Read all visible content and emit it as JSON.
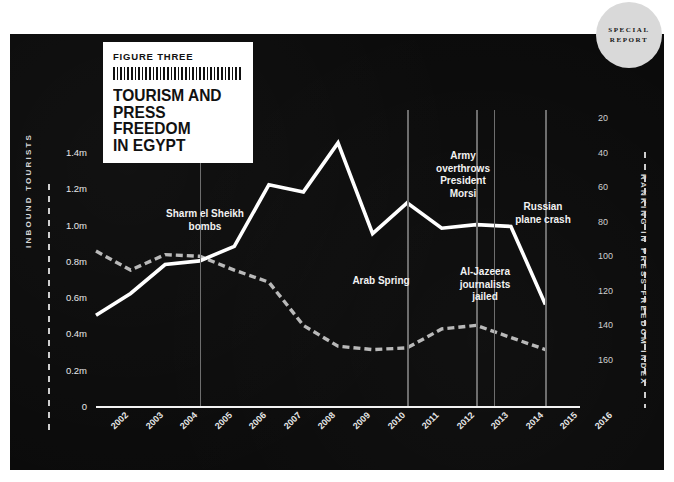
{
  "badge": {
    "line1": "SPECIAL",
    "line2": "REPORT"
  },
  "title": {
    "figure_label": "FIGURE THREE",
    "line1": "TOURISM AND",
    "line2": "PRESS FREEDOM",
    "line3": "IN EGYPT"
  },
  "axes": {
    "left_title": "INBOUND TOURISTS",
    "right_title": "RANKING IN PRESS FREEDOM INDEX"
  },
  "sources": "SOURCES: UNWTO, Press Freedom Index, Reporters Without Borders",
  "annotations": [
    {
      "text": "Sharm el Sheikh\nbombs",
      "year": 2005
    },
    {
      "text": "Arab Spring",
      "year": 2011
    },
    {
      "text": "Army\noverthrows\nPresident\nMorsi",
      "year": 2013
    },
    {
      "text": "Al-Jazeera\njournalists\njailed",
      "year": 2013
    },
    {
      "text": "Russian\nplane crash",
      "year": 2015
    }
  ],
  "chart_data": {
    "type": "line",
    "title": "TOURISM AND PRESS FREEDOM IN EGYPT",
    "xlabel": "",
    "x": [
      2002,
      2003,
      2004,
      2005,
      2006,
      2007,
      2008,
      2009,
      2010,
      2011,
      2012,
      2013,
      2014,
      2015
    ],
    "tick_labels": [
      "2002",
      "2003",
      "2004",
      "2005",
      "2006",
      "2007",
      "2008",
      "2009",
      "2010",
      "2011",
      "2012",
      "2013",
      "2014",
      "2015",
      "2016"
    ],
    "grid": false,
    "legend_position": "none",
    "series": [
      {
        "name": "Inbound tourists",
        "style": "solid",
        "axis": "left",
        "ylabel": "INBOUND TOURISTS",
        "ylim": [
          0,
          1.5
        ],
        "yticks": [
          0,
          0.2,
          0.4,
          0.6,
          0.8,
          1.0,
          1.2,
          1.4
        ],
        "ytick_labels": [
          "0",
          "0.2m",
          "0.4m",
          "0.6m",
          "0.8m",
          "1.0m",
          "1.2m",
          "1.4m"
        ],
        "values": [
          0.5,
          0.62,
          0.78,
          0.8,
          0.88,
          1.22,
          1.18,
          1.45,
          0.95,
          1.12,
          0.98,
          1.0,
          0.99,
          0.56
        ]
      },
      {
        "name": "Ranking in press freedom index",
        "style": "dashed",
        "axis": "right",
        "ylabel": "RANKING IN PRESS FREEDOM INDEX",
        "ylim": [
          10,
          170
        ],
        "inverted": true,
        "yticks": [
          20,
          40,
          60,
          80,
          100,
          120,
          140,
          160
        ],
        "ytick_labels": [
          "20",
          "40",
          "60",
          "80",
          "100",
          "120",
          "140",
          "160"
        ],
        "values": [
          97,
          108,
          99,
          100,
          108,
          115,
          140,
          152,
          154,
          153,
          142,
          140,
          147,
          154
        ]
      }
    ],
    "event_markers": [
      {
        "label": "Sharm el Sheikh bombs",
        "year": 2005
      },
      {
        "label": "Arab Spring",
        "year": 2011
      },
      {
        "label": "Al-Jazeera journalists jailed",
        "year": 2013
      },
      {
        "label": "Army overthrows President Morsi",
        "year": 2013.5
      },
      {
        "label": "Russian plane crash",
        "year": 2015
      }
    ]
  }
}
